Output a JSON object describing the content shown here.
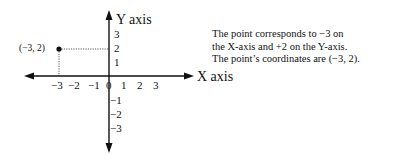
{
  "diagram": {
    "y_axis_label": "Y axis",
    "x_axis_label": "X axis",
    "x_ticks": [
      "−3",
      "−2",
      "−1",
      "0",
      "1",
      "2",
      "3"
    ],
    "y_ticks_positive": [
      "3",
      "2",
      "1"
    ],
    "y_ticks_negative": [
      "−1",
      "−2",
      "−3"
    ],
    "point": {
      "label": "(−3, 2)",
      "x": -3,
      "y": 2
    }
  },
  "description": {
    "lines": [
      "The point corresponds to −3 on",
      "the X-axis and +2 on the Y-axis.",
      "The point’s coordinates are (−3, 2)."
    ]
  }
}
